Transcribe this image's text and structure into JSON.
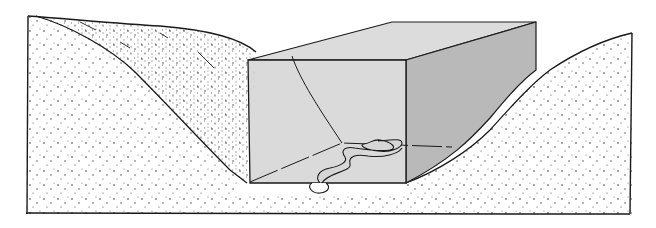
{
  "figure": {
    "colors": {
      "background": "#ffffff",
      "ink": "#1a1a1a",
      "box_front": "#d6d6d6",
      "box_top": "#dcdcdc",
      "box_side": "#b9b9b9",
      "stipple": "#333333"
    },
    "elements": {
      "left_hill": "stippled-terrain",
      "right_hill": "stippled-terrain",
      "box": "transparent-rectangular-prism",
      "stream": "meandering-river"
    }
  }
}
